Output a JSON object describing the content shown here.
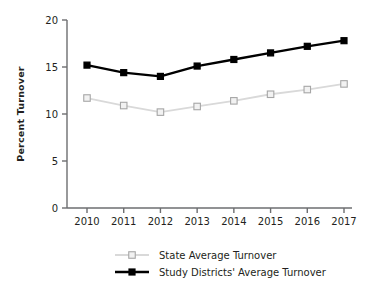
{
  "chart_data": {
    "type": "line",
    "title": "",
    "xlabel": "",
    "ylabel": "Percent Turnover",
    "categories": [
      "2010",
      "2011",
      "2012",
      "2013",
      "2014",
      "2015",
      "2016",
      "2017"
    ],
    "x": [
      2010,
      2011,
      2012,
      2013,
      2014,
      2015,
      2016,
      2017
    ],
    "ylim": [
      0,
      20
    ],
    "yticks": [
      0,
      5,
      10,
      15,
      20
    ],
    "ytick_labels": [
      "0",
      "5",
      "10",
      "15",
      "20"
    ],
    "grid": false,
    "legend_position": "bottom",
    "series": [
      {
        "name": "State Average Turnover",
        "color": "#d9d9d9",
        "marker": "open-square",
        "marker_edge_color": "#a6a6a6",
        "marker_face_color": "#f2f2f2",
        "values": [
          11.7,
          10.9,
          10.2,
          10.8,
          11.4,
          12.1,
          12.6,
          13.2
        ]
      },
      {
        "name": "Study Districts' Average Turnover",
        "color": "#000000",
        "marker": "filled-square",
        "marker_edge_color": "#000000",
        "marker_face_color": "#000000",
        "values": [
          15.2,
          14.4,
          14.0,
          15.1,
          15.8,
          16.5,
          17.2,
          17.8
        ]
      }
    ]
  },
  "axes": {
    "ylabel": "Percent Turnover"
  },
  "legend": {
    "items": [
      {
        "label": "State Average Turnover"
      },
      {
        "label": "Study Districts' Average Turnover"
      }
    ]
  },
  "colors": {
    "axis": "#6d6e70",
    "text": "#231f20",
    "series_state": "#d9d9d9",
    "series_study": "#000000"
  }
}
